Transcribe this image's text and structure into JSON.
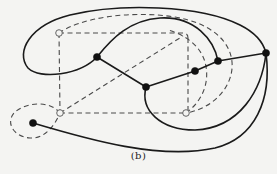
{
  "caption": "(b)",
  "colors": {
    "background": "#f4f4f2",
    "solid_edge": "#1a1a1a",
    "dashed_edge": "#4a4a4a",
    "filled_node": "#111111",
    "hollow_node_stroke": "#555555"
  },
  "graph": {
    "filled_nodes": [
      {
        "id": "A",
        "x": 97,
        "y": 57
      },
      {
        "id": "B",
        "x": 146,
        "y": 87
      },
      {
        "id": "C",
        "x": 195,
        "y": 71
      },
      {
        "id": "D",
        "x": 218,
        "y": 61
      },
      {
        "id": "E",
        "x": 266,
        "y": 53
      },
      {
        "id": "F",
        "x": 33,
        "y": 123
      }
    ],
    "hollow_nodes": [
      {
        "id": "P",
        "x": 59,
        "y": 33
      },
      {
        "id": "Q",
        "x": 60,
        "y": 113
      },
      {
        "id": "R",
        "x": 186,
        "y": 113
      }
    ],
    "solid_edges": [
      {
        "from": "A",
        "to": "B",
        "d": "M97,57 L146,87"
      },
      {
        "from": "B",
        "to": "C",
        "d": "M146,87 L195,71"
      },
      {
        "from": "C",
        "to": "D",
        "d": "M195,71 L218,61"
      },
      {
        "from": "D",
        "to": "E",
        "d": "M218,61 L266,53"
      },
      {
        "from": "A",
        "to": "E",
        "label": "outer-loop-left",
        "d": "M97,57 C80,75 40,80 28,68 C15,52 30,25 70,15 C120,3 200,5 240,25 C258,34 264,45 266,53"
      },
      {
        "from": "A",
        "to": "D",
        "label": "arc-over-top",
        "d": "M97,57 C112,38 130,20 160,18 C195,16 214,40 218,61"
      },
      {
        "from": "B",
        "to": "E",
        "label": "arc-under",
        "d": "M146,87 C140,110 160,130 195,130 C240,128 262,90 266,53"
      },
      {
        "from": "F",
        "to": "E",
        "label": "long-bottom-arc",
        "d": "M33,123 C90,140 160,160 215,148 C255,138 272,100 266,53"
      }
    ],
    "dashed_edges": [
      {
        "label": "rect-top",
        "d": "M59,33 L183,33 Q188,33 188,38"
      },
      {
        "label": "rect-right",
        "d": "M188,38 L188,113"
      },
      {
        "label": "rect-bottom",
        "d": "M60,113 L186,113"
      },
      {
        "label": "rect-left",
        "d": "M59,33 L60,113"
      },
      {
        "label": "diagonal",
        "d": "M60,113 L183,36"
      },
      {
        "label": "top-left-arc",
        "d": "M59,33 C80,18 130,10 175,17 C210,23 230,40 232,62 C234,85 215,108 186,113"
      },
      {
        "label": "inner-arc",
        "d": "M186,113 C204,100 210,80 205,62 C200,45 185,35 168,30"
      },
      {
        "label": "loop-around-F",
        "d": "M60,113 C50,100 25,102 14,113 C5,124 15,137 30,138 C45,139 55,125 60,113"
      }
    ]
  }
}
